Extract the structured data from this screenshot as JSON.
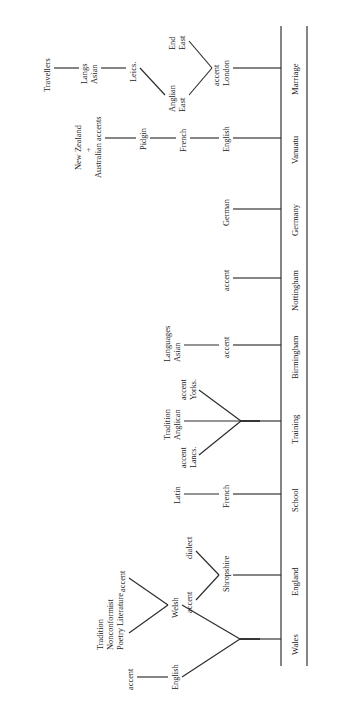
{
  "figure": {
    "type": "diagram",
    "orientation": "rotated-90-ccw"
  },
  "axis": {
    "name": "life-stage-axis",
    "stages": [
      {
        "key": "wales",
        "label": "Wales"
      },
      {
        "key": "england",
        "label": "England"
      },
      {
        "key": "school",
        "label": "School"
      },
      {
        "key": "training",
        "label": "Training"
      },
      {
        "key": "birmingham",
        "label": "Birmingham"
      },
      {
        "key": "nottingham",
        "label": "Nottingham"
      },
      {
        "key": "germany",
        "label": "Germany"
      },
      {
        "key": "vanuatu",
        "label": "Vanuatu"
      },
      {
        "key": "marriage",
        "label": "Marriage"
      }
    ]
  },
  "branches": {
    "wales": {
      "stage": "Wales",
      "nodes": [
        "Welsh",
        "English"
      ],
      "leaves": [
        "accent",
        "accent"
      ],
      "tip_label": "Poetry Literature Nonconformist Tradition",
      "tip_lines": [
        "Poetry Literature",
        "Nonconformist",
        "Tradition"
      ]
    },
    "england": {
      "stage": "England",
      "nodes": [
        "Shropshire"
      ],
      "leaves": [
        "dialect",
        "accent"
      ]
    },
    "school": {
      "stage": "School",
      "nodes": [
        "French",
        "Latin"
      ]
    },
    "training": {
      "stage": "Training",
      "nodes": [
        "Anglican Tradition"
      ],
      "node_lines": [
        "Anglican",
        "Tradition"
      ],
      "leaves": [
        "Yorks. accent",
        "Lancs. accent"
      ],
      "leaf_lines": [
        [
          "Yorks.",
          "accent"
        ],
        [
          "Lancs.",
          "accent"
        ]
      ]
    },
    "birmingham": {
      "stage": "Birmingham",
      "nodes": [
        "accent",
        "Asian Languages"
      ],
      "node_lines": [
        "Asian",
        "Languages"
      ]
    },
    "nottingham": {
      "stage": "Nottingham",
      "nodes": [
        "accent"
      ]
    },
    "germany": {
      "stage": "Germany",
      "nodes": [
        "German"
      ]
    },
    "vanuatu": {
      "stage": "Vanuatu",
      "nodes": [
        "English",
        "French",
        "Pidgin",
        "New Zealand + Australian accents"
      ],
      "node_lines": [
        "New Zealand",
        "+",
        "Australian accents"
      ]
    },
    "marriage": {
      "stage": "Marriage",
      "nodes": [
        "London accent",
        "East Anglian",
        "East End",
        "Leics.",
        "Asian Langs",
        "Travellers"
      ],
      "london_lines": [
        "London",
        "accent"
      ],
      "east_anglian_lines": [
        "East",
        "Anglian"
      ],
      "east_end_lines": [
        "East",
        "End"
      ],
      "asian_langs_lines": [
        "Asian",
        "Langs"
      ]
    }
  },
  "labels": {
    "travellers": "Travellers",
    "asian_langs_1": "Asian",
    "asian_langs_2": "Langs",
    "leics": "Leics.",
    "east_end_1": "East",
    "east_end_2": "End",
    "east_anglian_1": "East",
    "east_anglian_2": "Anglian",
    "london_1": "London",
    "london_2": "accent",
    "new_zealand": "New Zealand",
    "plus": "+",
    "australian_accents": "Australian accents",
    "pidgin": "Pidgin",
    "french_vanuatu": "French",
    "english_vanuatu": "English",
    "german": "German",
    "accent_nottingham": "accent",
    "accent_birmingham": "accent",
    "asian_languages_1": "Asian",
    "asian_languages_2": "Languages",
    "yorks_1": "Yorks.",
    "yorks_2": "accent",
    "anglican_1": "Anglican",
    "anglican_2": "Tradition",
    "lancs_1": "Lancs.",
    "lancs_2": "accent",
    "latin": "Latin",
    "french_school": "French",
    "dialect": "dialect",
    "shropshire": "Shropshire",
    "accent_shropshire": "accent",
    "accent_welsh": "accent",
    "welsh": "Welsh",
    "poetry_1": "Poetry Literature",
    "poetry_2": "Nonconformist",
    "poetry_3": "Tradition",
    "accent_english": "accent",
    "english_wales": "English",
    "stage_marriage": "Marriage",
    "stage_vanuatu": "Vanuatu",
    "stage_germany": "Germany",
    "stage_nottingham": "Nottingham",
    "stage_birmingham": "Birmingham",
    "stage_training": "Training",
    "stage_school": "School",
    "stage_england": "England",
    "stage_wales": "Wales"
  },
  "colors": {
    "ink": "#1a1a1a",
    "line": "#2b2b2b",
    "paper": "#ffffff"
  }
}
